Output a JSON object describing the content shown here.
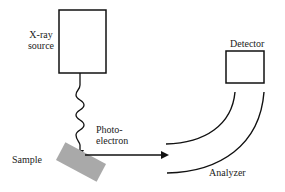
{
  "diagram": {
    "labels": {
      "xray_line1": "X-ray",
      "xray_line2": "source",
      "detector": "Detector",
      "photo_line1": "Photo-",
      "photo_line2": "electron",
      "sample": "Sample",
      "analyzer": "Analyzer"
    },
    "colors": {
      "stroke": "#111111",
      "sample_fill": "#a9a9a9"
    }
  }
}
